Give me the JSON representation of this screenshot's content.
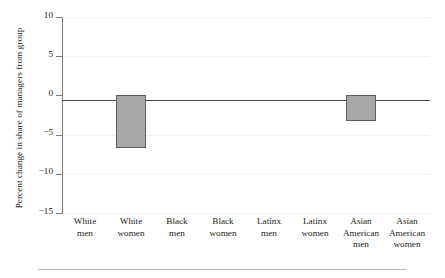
{
  "chart_data": {
    "type": "bar",
    "title": "",
    "subtitle": "",
    "xlabel": "",
    "ylabel": "Percent change in share of managers from group",
    "categories": [
      "White men",
      "White women",
      "Black men",
      "Black women",
      "Latinx men",
      "Latinx women",
      "Asian American men",
      "Asian American women"
    ],
    "category_lines": [
      [
        "White",
        "men"
      ],
      [
        "White",
        "women"
      ],
      [
        "Black",
        "men"
      ],
      [
        "Black",
        "women"
      ],
      [
        "Latinx",
        "men"
      ],
      [
        "Latinx",
        "women"
      ],
      [
        "Asian",
        "American",
        "men"
      ],
      [
        "Asian",
        "American",
        "women"
      ]
    ],
    "values": [
      0,
      -6.7,
      0,
      0,
      0,
      0,
      -3.3,
      0
    ],
    "ylim": [
      -15,
      10
    ],
    "yticks": [
      10,
      5,
      0,
      -5,
      -10,
      -15
    ],
    "ytick_labels": [
      "10",
      "5",
      "0",
      "−5",
      "−10",
      "−15"
    ],
    "grid": "horizontal-faint",
    "legend": "none",
    "bar_fill_color": "#a8a8a8",
    "bar_edge_color": "#5e5e5e",
    "axis_color": "#7d7d7d",
    "zero_line_color": "#4a4a4a",
    "text_color": "#231f20",
    "background_color": "#ffffff",
    "rule_color": "#b9b9b9"
  }
}
